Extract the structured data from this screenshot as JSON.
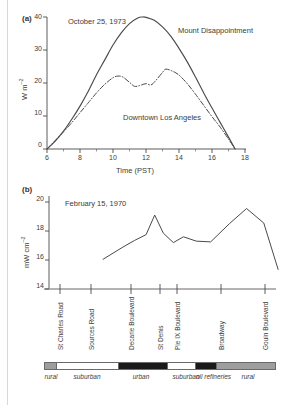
{
  "figure": {
    "background": "#ffffff",
    "ink": "#4a4a4a"
  },
  "panel_a": {
    "tag": "(a)",
    "date_label": "October 25, 1973",
    "ylabel_main": "W m",
    "ylabel_exp": "–2",
    "xlabel": "Time (PST)",
    "label_mount": "Mount Disappointment",
    "label_downtown": "Downtown Los Angeles",
    "yticks": [
      "0",
      "10",
      "20",
      "30",
      "40"
    ],
    "xticks": [
      "06.00",
      "08.00",
      "10.00",
      "12.00",
      "14.00",
      "16.00",
      "18.00"
    ]
  },
  "panel_b": {
    "tag": "(b)",
    "date_label": "February 15, 1970",
    "ylabel_main": "mW cm",
    "ylabel_exp": "–2",
    "yticks": [
      "14",
      "16",
      "18",
      "20"
    ],
    "streets": [
      "St Charles Road",
      "Sources Road",
      "Decarie Boulevard",
      "St Denis",
      "Pie IX Boulevard",
      "Broadway",
      "Gouin Boulevard"
    ],
    "landuse": [
      {
        "name": "rural",
        "color": "#9e9e9e"
      },
      {
        "name": "suburban",
        "color": "#ffffff"
      },
      {
        "name": "urban",
        "color": "#1a1a1a"
      },
      {
        "name": "suburban",
        "color": "#ffffff"
      },
      {
        "name": "oil refineries",
        "color": "#1a1a1a"
      },
      {
        "name": "rural",
        "color": "#9e9e9e"
      }
    ]
  },
  "chart_data": [
    {
      "type": "line",
      "panel": "(a)",
      "title": "October 25, 1973",
      "xlabel": "Time (PST)",
      "ylabel": "W m–2",
      "xlim": [
        6,
        18
      ],
      "ylim": [
        0,
        42
      ],
      "xticks": [
        6,
        8,
        10,
        12,
        14,
        16,
        18
      ],
      "yticks": [
        0,
        10,
        20,
        30,
        40
      ],
      "grid": false,
      "legend": "inline-annotations",
      "series": [
        {
          "name": "Mount Disappointment",
          "style": "solid",
          "x": [
            6.0,
            6.5,
            7.0,
            7.5,
            8.0,
            8.5,
            9.0,
            9.5,
            10.0,
            10.5,
            11.0,
            11.5,
            11.8,
            12.0,
            12.5,
            13.0,
            13.5,
            14.0,
            14.5,
            15.0,
            15.5,
            16.0,
            16.5,
            17.0,
            17.4
          ],
          "y": [
            0.0,
            2.4,
            5.4,
            9.0,
            13.0,
            17.5,
            22.5,
            27.0,
            31.5,
            35.2,
            38.0,
            39.7,
            40.0,
            39.9,
            39.0,
            37.0,
            34.2,
            30.5,
            26.4,
            21.8,
            17.0,
            12.4,
            8.0,
            3.6,
            0.0
          ]
        },
        {
          "name": "Downtown Los Angeles",
          "style": "dash-dot",
          "x": [
            6.0,
            6.5,
            7.0,
            7.5,
            8.0,
            8.5,
            9.0,
            9.5,
            10.0,
            10.3,
            10.6,
            11.0,
            11.3,
            11.6,
            12.0,
            12.3,
            12.6,
            13.0,
            13.2,
            13.6,
            14.0,
            14.5,
            15.0,
            15.5,
            16.0,
            16.5,
            17.0,
            17.4
          ],
          "y": [
            0.0,
            2.6,
            5.2,
            8.0,
            11.0,
            14.0,
            17.0,
            19.6,
            21.6,
            22.1,
            21.8,
            20.2,
            19.0,
            19.2,
            19.8,
            19.4,
            20.8,
            23.2,
            24.2,
            23.6,
            22.4,
            19.8,
            16.6,
            13.2,
            9.8,
            6.6,
            3.0,
            0.0
          ]
        }
      ]
    },
    {
      "type": "line",
      "panel": "(b)",
      "title": "February 15, 1970",
      "xlabel": "",
      "ylabel": "mW cm–2",
      "ylim": [
        14,
        20.6
      ],
      "yticks": [
        14,
        16,
        18,
        20
      ],
      "grid": false,
      "categories": [
        "St Charles Road",
        "Sources Road",
        "Decarie Boulevard",
        "St Denis",
        "Pie IX Boulevard",
        "Broadway",
        "Gouin Boulevard"
      ],
      "series": [
        {
          "name": "solar radiation transect",
          "style": "solid",
          "x": [
            0.3,
            0.44,
            0.52,
            0.6,
            0.66,
            0.72,
            0.79,
            0.86,
            0.95,
            1.05,
            1.18,
            1.3,
            1.42,
            1.52
          ],
          "y": [
            16.05,
            16.9,
            17.35,
            17.75,
            19.1,
            17.85,
            17.2,
            17.6,
            17.3,
            17.25,
            18.5,
            19.55,
            18.55,
            15.35
          ]
        }
      ]
    }
  ]
}
